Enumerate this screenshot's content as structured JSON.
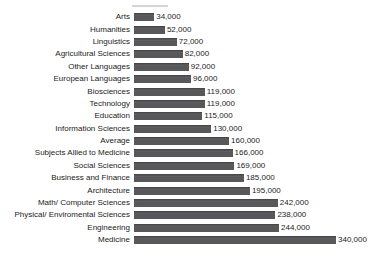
{
  "window": {
    "background": "#ffffff"
  },
  "chart_data": {
    "type": "bar",
    "orientation": "horizontal",
    "title": "",
    "xlabel": "",
    "ylabel": "",
    "grid": false,
    "legend": false,
    "bar_color": "#58585a",
    "text_color": "#1c1c1c",
    "xlim": [
      0,
      400000
    ],
    "categories": [
      "Arts",
      "Humanities",
      "Linguistics",
      "Agricultural Sciences",
      "Other Languages",
      "European Languages",
      "Biosciences",
      "Technology",
      "Education",
      "Information Sciences",
      "Average",
      "Subjects Allied to Medicine",
      "Social Sciences",
      "Business and Finance",
      "Architecture",
      "Math/ Computer Sciences",
      "Physical/ Enviromental Sciences",
      "Engineering",
      "Medicine"
    ],
    "values": [
      34000,
      52000,
      72000,
      82000,
      92000,
      96000,
      119000,
      119000,
      115000,
      130000,
      160000,
      166000,
      169000,
      185000,
      195000,
      242000,
      238000,
      244000,
      340000
    ],
    "value_labels": [
      "34,000",
      "52,000",
      "72,000",
      "82,000",
      "92,000",
      "96,000",
      "119,000",
      "119,000",
      "115,000",
      "130,000",
      "160,000",
      "166,000",
      "169,000",
      "185,000",
      "195,000",
      "242,000",
      "238,000",
      "244,000",
      "340,000"
    ]
  }
}
